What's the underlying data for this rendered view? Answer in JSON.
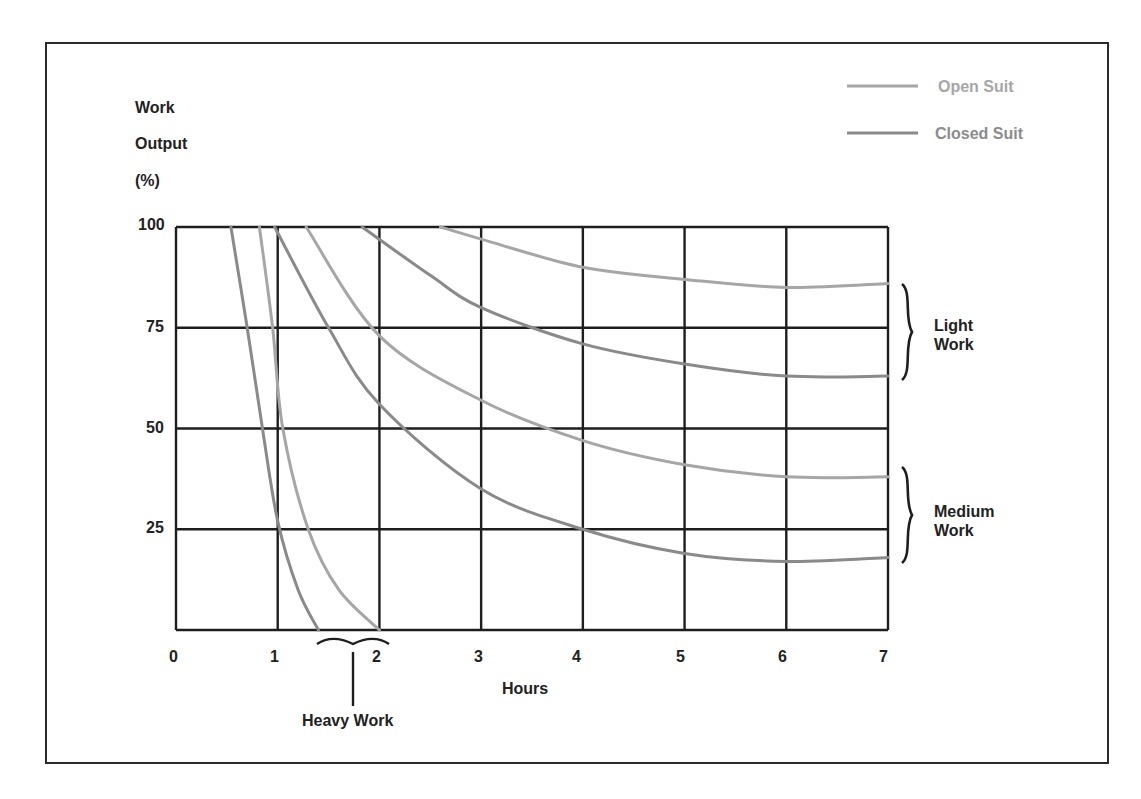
{
  "chart_data": {
    "type": "line",
    "title": "",
    "xlabel": "Hours",
    "ylabel": [
      "Work",
      "Output",
      "(%)"
    ],
    "xlim": [
      0,
      7
    ],
    "ylim": [
      0,
      100
    ],
    "x_ticks": [
      "0",
      "1",
      "2",
      "3",
      "4",
      "5",
      "6",
      "7"
    ],
    "y_ticks": [
      "100",
      "75",
      "50",
      "25"
    ],
    "grid": true,
    "legend": {
      "position": "top-right",
      "entries": [
        {
          "name": "Open Suit",
          "color": "#a6a6a6"
        },
        {
          "name": "Closed Suit",
          "color": "#8a8a8a"
        }
      ]
    },
    "series": [
      {
        "name": "Closed Suit",
        "group": "Heavy Work",
        "color": "#8a8a8a",
        "points": [
          [
            0.54,
            100
          ],
          [
            0.7,
            75
          ],
          [
            0.85,
            50
          ],
          [
            1.0,
            27
          ],
          [
            1.2,
            10
          ],
          [
            1.4,
            0
          ]
        ]
      },
      {
        "name": "Open Suit",
        "group": "Heavy Work",
        "color": "#a6a6a6",
        "points": [
          [
            0.82,
            100
          ],
          [
            0.95,
            75
          ],
          [
            1.05,
            50
          ],
          [
            1.3,
            25
          ],
          [
            1.6,
            10
          ],
          [
            2.0,
            0
          ]
        ]
      },
      {
        "name": "Closed Suit",
        "group": "Medium Work",
        "color": "#8a8a8a",
        "points": [
          [
            0.97,
            100
          ],
          [
            1.5,
            75
          ],
          [
            2.0,
            56
          ],
          [
            3.0,
            35
          ],
          [
            4.0,
            25
          ],
          [
            5.0,
            19
          ],
          [
            6.0,
            17
          ],
          [
            7.0,
            18
          ]
        ]
      },
      {
        "name": "Open Suit",
        "group": "Medium Work",
        "color": "#a6a6a6",
        "points": [
          [
            1.28,
            100
          ],
          [
            2.0,
            73
          ],
          [
            3.0,
            57
          ],
          [
            4.0,
            47
          ],
          [
            5.0,
            41
          ],
          [
            6.0,
            38
          ],
          [
            7.0,
            38
          ]
        ]
      },
      {
        "name": "Closed Suit",
        "group": "Light Work",
        "color": "#8a8a8a",
        "points": [
          [
            1.83,
            100
          ],
          [
            2.5,
            88
          ],
          [
            3.0,
            80
          ],
          [
            4.0,
            71
          ],
          [
            5.0,
            66
          ],
          [
            6.0,
            63
          ],
          [
            7.0,
            63
          ]
        ]
      },
      {
        "name": "Open Suit",
        "group": "Light Work",
        "color": "#a6a6a6",
        "points": [
          [
            2.6,
            100
          ],
          [
            3.0,
            97
          ],
          [
            4.0,
            90
          ],
          [
            5.0,
            87
          ],
          [
            6.0,
            85
          ],
          [
            7.0,
            86
          ]
        ]
      }
    ],
    "annotations": [
      {
        "text": "Light Work",
        "type": "brace",
        "range_pct": [
          63,
          86
        ]
      },
      {
        "text": "Medium Work",
        "type": "brace",
        "range_pct": [
          17,
          38
        ]
      },
      {
        "text": "Heavy Work",
        "type": "brace",
        "range_hours": [
          1.4,
          2.0
        ]
      }
    ]
  },
  "labels": {
    "y_title_1": "Work",
    "y_title_2": "Output",
    "y_title_3": "(%)",
    "x_title": "Hours",
    "legend_open": "Open Suit",
    "legend_closed": "Closed Suit",
    "light_1": "Light",
    "light_2": "Work",
    "medium_1": "Medium",
    "medium_2": "Work",
    "heavy": "Heavy Work",
    "y100": "100",
    "y75": "75",
    "y50": "50",
    "y25": "25",
    "x0": "0",
    "x1": "1",
    "x2": "2",
    "x3": "3",
    "x4": "4",
    "x5": "5",
    "x6": "6",
    "x7": "7"
  }
}
